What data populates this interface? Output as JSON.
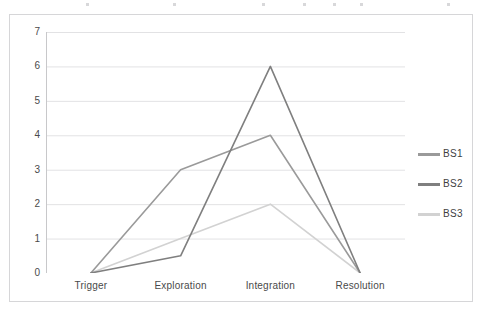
{
  "chart_data": {
    "type": "line",
    "title": "",
    "xlabel": "",
    "ylabel": "",
    "categories": [
      "Trigger",
      "Exploration",
      "Integration",
      "Resolution"
    ],
    "ylim": [
      0,
      7
    ],
    "yticks": [
      0,
      1,
      2,
      3,
      4,
      5,
      6,
      7
    ],
    "ytick_labels": [
      "0",
      "1",
      "2",
      "3",
      "4",
      "5",
      "6",
      "7"
    ],
    "grid": true,
    "grid_axis": "y",
    "legend_position": "right",
    "series": [
      {
        "name": "BS1",
        "values": [
          0,
          3,
          4,
          0
        ],
        "color": "#9a9a9a"
      },
      {
        "name": "BS2",
        "values": [
          0,
          0.5,
          6,
          0
        ],
        "color": "#7f7f7f"
      },
      {
        "name": "BS3",
        "values": [
          0,
          1,
          2,
          0
        ],
        "color": "#d2d2d2"
      }
    ]
  },
  "axes": {
    "y_tick_labels": [
      "7",
      "6",
      "5",
      "4",
      "3",
      "2",
      "1",
      "0"
    ],
    "x_tick_labels": [
      "Trigger",
      "Exploration",
      "Integration",
      "Resolution"
    ]
  },
  "legend": {
    "items": [
      {
        "label": "BS1"
      },
      {
        "label": "BS2"
      },
      {
        "label": "BS3"
      }
    ]
  },
  "colors": {
    "series_bs1": "#9a9a9a",
    "series_bs2": "#7f7f7f",
    "series_bs3": "#d2d2d2",
    "gridline": "#e2e2e4",
    "axis": "#c8c8ca",
    "frame": "#d6d6d8",
    "text": "#4a4a4a",
    "background": "#ffffff"
  }
}
